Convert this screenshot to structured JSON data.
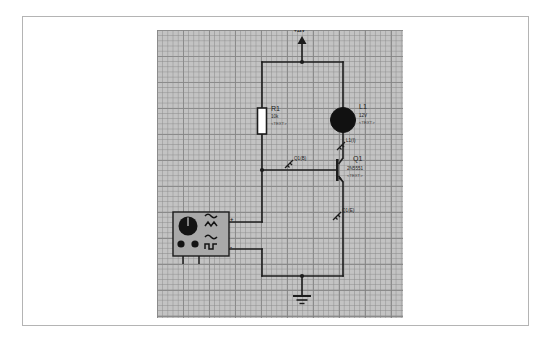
{
  "page": {
    "background_color": "#ffffff",
    "frame_color": "#b4b4b4"
  },
  "canvas": {
    "name": "schematic-canvas",
    "background_color": "#c3c3c3",
    "grid_color": "#8c8c8c",
    "wire_color": "#1c1c1c"
  },
  "supply": {
    "label": "+12V",
    "symbol": "vcc-arrow"
  },
  "components": {
    "r1": {
      "ref": "R1",
      "value": "10k",
      "text_tag": "<TEXT>",
      "symbol": "resistor"
    },
    "l1": {
      "ref": "L1",
      "value": "12V",
      "text_tag": "<TEXT>",
      "symbol": "lamp"
    },
    "q1": {
      "ref": "Q1",
      "value": "2N5551",
      "text_tag": "<TEXT>",
      "symbol": "npn-transistor"
    },
    "ground": {
      "symbol": "ground"
    },
    "function_generator": {
      "name": "function-generator",
      "plus_terminal": "+",
      "minus_terminal": "-",
      "waveforms": [
        "sine",
        "triangle",
        "square"
      ],
      "knob": "frequency-knob",
      "buttons": [
        "button-left",
        "button-right"
      ]
    }
  },
  "probes": [
    {
      "id": "probe-l1",
      "label": "L1(I)"
    },
    {
      "id": "probe-q1-b",
      "label": "Q1(B)"
    },
    {
      "id": "probe-q1-e",
      "label": "Q1(E)"
    }
  ]
}
